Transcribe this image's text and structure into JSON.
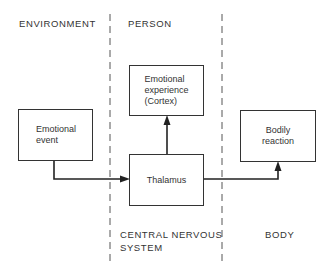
{
  "regions": {
    "environment": "ENVIRONMENT",
    "person": "PERSON",
    "cns_line1": "CENTRAL NERVOUS",
    "cns_line2": "SYSTEM",
    "body": "BODY"
  },
  "boxes": {
    "emotional_event": "Emotional\nevent",
    "emotional_experience": "Emotional\nexperience\n(Cortex)",
    "thalamus": "Thalamus",
    "bodily_reaction": "Bodily\nreaction"
  },
  "colors": {
    "line": "#333333",
    "background": "#ffffff"
  }
}
